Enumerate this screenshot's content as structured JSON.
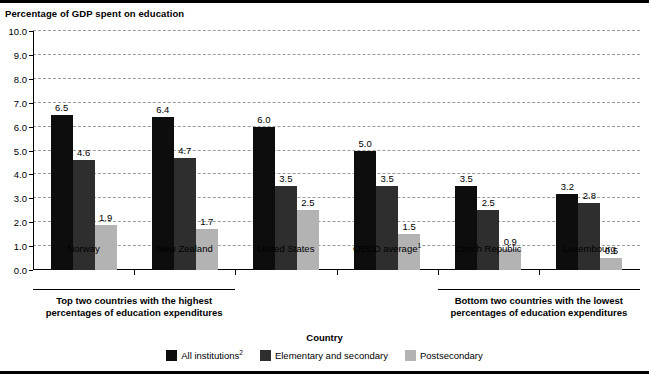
{
  "chart_data": {
    "type": "bar",
    "title": "",
    "ylabel": "Percentage of GDP spent on education",
    "xlabel": "Country",
    "ylim": [
      0,
      10
    ],
    "ytick_labels": [
      "10.0",
      "9.0",
      "8.0",
      "7.0",
      "6.0",
      "5.0",
      "4.0",
      "3.0",
      "2.0",
      "1.0",
      "0.0"
    ],
    "ytick_values": [
      10,
      9,
      8,
      7,
      6,
      5,
      4,
      3,
      2,
      1,
      0
    ],
    "grid": true,
    "legend_position": "bottom",
    "categories": [
      "Norway",
      "New Zealand",
      "United States",
      "OECD average",
      "Czech Republic",
      "Luxembourg"
    ],
    "category_labels": [
      {
        "text": "Norway",
        "sup": ""
      },
      {
        "text": "New Zealand",
        "sup": ""
      },
      {
        "text": "United States",
        "sup": ""
      },
      {
        "text": "OECD average",
        "sup": "1"
      },
      {
        "text": "Czech Republic",
        "sup": ""
      },
      {
        "text": "Luxembourg",
        "sup": ""
      }
    ],
    "series": [
      {
        "name": "All institutions",
        "sup": "2",
        "color": "#0d0d0d",
        "values": [
          6.5,
          6.4,
          6.0,
          5.0,
          3.5,
          3.2
        ]
      },
      {
        "name": "Elementary and secondary",
        "sup": "",
        "color": "#2e2e2e",
        "values": [
          4.6,
          4.7,
          3.5,
          3.5,
          2.5,
          2.8
        ]
      },
      {
        "name": "Postsecondary",
        "sup": "",
        "color": "#b3b3b3",
        "values": [
          1.9,
          1.7,
          2.5,
          1.5,
          0.9,
          0.5
        ]
      }
    ],
    "value_labels": [
      [
        "6.5",
        "4.6",
        "1.9"
      ],
      [
        "6.4",
        "4.7",
        "1.7"
      ],
      [
        "6.0",
        "3.5",
        "2.5"
      ],
      [
        "5.0",
        "3.5",
        "1.5"
      ],
      [
        "3.5",
        "2.5",
        "0.9"
      ],
      [
        "3.2",
        "2.8",
        "0.5"
      ]
    ],
    "annotations": [
      {
        "line1": "Top two countries with the highest",
        "line2": "percentages of education expenditures",
        "spans": [
          "Norway",
          "New Zealand"
        ]
      },
      {
        "line1": "Bottom two countries with the lowest",
        "line2": "percentages of education expenditures",
        "spans": [
          "Czech Republic",
          "Luxembourg"
        ]
      }
    ]
  }
}
